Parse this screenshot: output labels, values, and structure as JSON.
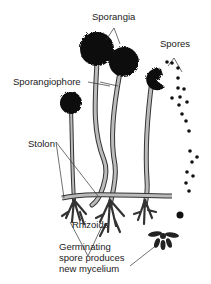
{
  "diagram": {
    "labels": {
      "sporangia": "Sporangia",
      "spores": "Spores",
      "sporangiophore": "Sporangiophore",
      "stolon": "Stolon",
      "rhizoids": "Rhizoids",
      "germinating_1": "Germinating",
      "germinating_2": "spore produces",
      "germinating_3": "new mycelium"
    },
    "colors": {
      "ink": "#111111",
      "stalk": "#9a9a9a",
      "background": "#ffffff"
    }
  }
}
